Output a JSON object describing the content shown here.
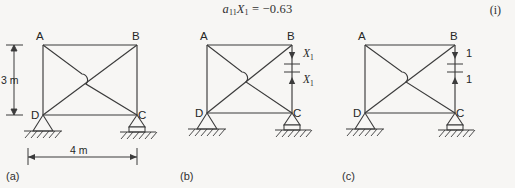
{
  "equation": {
    "lhs_a": "a",
    "lhs_a_sub": "11",
    "lhs_x": "X",
    "lhs_x_sub": "1",
    "equals": "=",
    "rhs": "−0.63",
    "tag": "(i)"
  },
  "figure": {
    "panels": [
      {
        "id": "a",
        "caption": "(a)",
        "nodes": [
          {
            "name": "A",
            "label": "A",
            "position": "top-left"
          },
          {
            "name": "B",
            "label": "B",
            "position": "top-right"
          },
          {
            "name": "C",
            "label": "C",
            "position": "bottom-right"
          },
          {
            "name": "D",
            "label": "D",
            "position": "bottom-left"
          }
        ],
        "members": [
          "AB",
          "AD",
          "DC",
          "BC",
          "AC",
          "DB"
        ],
        "crossing_symbol": "wire-hop",
        "supports": [
          {
            "node": "D",
            "type": "pin"
          },
          {
            "node": "C",
            "type": "roller"
          }
        ],
        "dimensions": [
          {
            "name": "height",
            "label": "3 m",
            "orientation": "vertical"
          },
          {
            "name": "span",
            "label": "4 m",
            "orientation": "horizontal"
          }
        ],
        "forces": []
      },
      {
        "id": "b",
        "caption": "(b)",
        "nodes": [
          {
            "name": "A",
            "label": "A",
            "position": "top-left"
          },
          {
            "name": "B",
            "label": "B",
            "position": "top-right"
          },
          {
            "name": "C",
            "label": "C",
            "position": "bottom-right"
          },
          {
            "name": "D",
            "label": "D",
            "position": "bottom-left"
          }
        ],
        "members": [
          "AB",
          "AD",
          "DC",
          "BC",
          "AC",
          "DB"
        ],
        "crossing_symbol": "wire-hop",
        "supports": [
          {
            "node": "D",
            "type": "pin"
          },
          {
            "node": "C",
            "type": "roller"
          }
        ],
        "dimensions": [],
        "cut": {
          "member": "BC",
          "note": "cut-section"
        },
        "forces": [
          {
            "name": "upper",
            "label": "X",
            "sub": "1",
            "direction": "down"
          },
          {
            "name": "lower",
            "label": "X",
            "sub": "1",
            "direction": "up"
          }
        ]
      },
      {
        "id": "c",
        "caption": "(c)",
        "nodes": [
          {
            "name": "A",
            "label": "A",
            "position": "top-left"
          },
          {
            "name": "B",
            "label": "B",
            "position": "top-right"
          },
          {
            "name": "C",
            "label": "C",
            "position": "bottom-right"
          },
          {
            "name": "D",
            "label": "D",
            "position": "bottom-left"
          }
        ],
        "members": [
          "AB",
          "AD",
          "DC",
          "BC",
          "AC",
          "DB"
        ],
        "crossing_symbol": "wire-hop",
        "supports": [
          {
            "node": "D",
            "type": "pin"
          },
          {
            "node": "C",
            "type": "roller"
          }
        ],
        "dimensions": [],
        "cut": {
          "member": "BC",
          "note": "cut-section"
        },
        "forces": [
          {
            "name": "upper",
            "label": "1",
            "sub": "",
            "direction": "down"
          },
          {
            "name": "lower",
            "label": "1",
            "sub": "",
            "direction": "up"
          }
        ]
      }
    ]
  },
  "colors": {
    "page_background": "#f7f6f4",
    "ink": "#3b3b3b",
    "text": "#262626"
  }
}
